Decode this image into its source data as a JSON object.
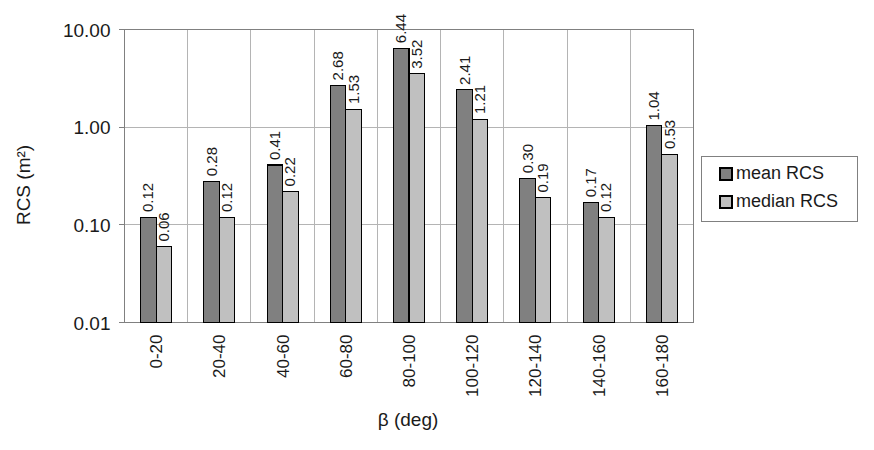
{
  "chart_data": {
    "type": "bar",
    "title": "",
    "subtitle": "",
    "xlabel": "β (deg)",
    "ylabel": "RCS (m²)",
    "yscale": "log",
    "ylim": [
      0.01,
      10.0
    ],
    "ytick_labels": [
      "10.00",
      "1.00",
      "0.10",
      "0.01"
    ],
    "ytick_values": [
      10.0,
      1.0,
      0.1,
      0.01
    ],
    "grid": true,
    "legend_position": "right",
    "categories": [
      "0-20",
      "20-40",
      "40-60",
      "60-80",
      "80-100",
      "100-120",
      "120-140",
      "140-160",
      "160-180"
    ],
    "series": [
      {
        "name": "mean RCS",
        "color": "#808080",
        "values": [
          0.12,
          0.28,
          0.41,
          2.68,
          6.44,
          2.41,
          0.3,
          0.17,
          1.04
        ],
        "labels": [
          "0.12",
          "0.28",
          "0.41",
          "2.68",
          "6.44",
          "2.41",
          "0.30",
          "0.17",
          "1.04"
        ]
      },
      {
        "name": "median RCS",
        "color": "#c0c0c0",
        "values": [
          0.06,
          0.12,
          0.22,
          1.53,
          3.52,
          1.21,
          0.19,
          0.12,
          0.53
        ],
        "labels": [
          "0.06",
          "0.12",
          "0.22",
          "1.53",
          "3.52",
          "1.21",
          "0.19",
          "0.12",
          "0.53"
        ]
      }
    ]
  },
  "legend": {
    "entries": [
      {
        "label": "mean RCS",
        "swatch_color": "#808080"
      },
      {
        "label": "median RCS",
        "swatch_color": "#c0c0c0"
      }
    ]
  },
  "axes": {
    "y_title": "RCS (m²)",
    "x_title": "β (deg)"
  },
  "style": {
    "plot_border_color": "#808080",
    "grid_color": "#b4b4b4",
    "bar_outline_color": "#000000",
    "background": "#ffffff"
  }
}
